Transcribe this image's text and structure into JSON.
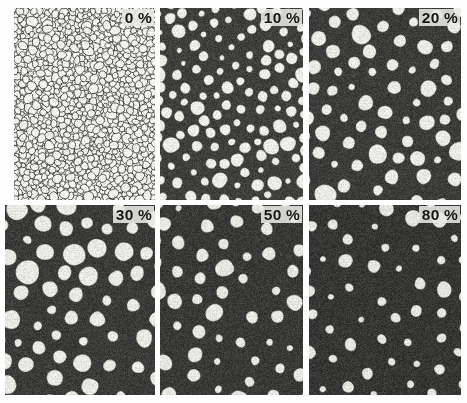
{
  "figure": {
    "rows": 2,
    "columns": 3,
    "background_color": "#fefefe",
    "grain_color": "#ececE6",
    "matrix_color": "#3a3a3a",
    "boundary_color": "#262626",
    "label_text_color": "#141414",
    "label_background_color": "#e8e8e4"
  },
  "panels": [
    {
      "id": "panel-0",
      "label": "0 %",
      "value": 0,
      "unit": "%",
      "row": 0,
      "column": 0,
      "x": 14,
      "y": 8,
      "width": 141,
      "height": 192,
      "grain_count": 1100,
      "mean_grain_diameter_px": 6,
      "boundary_thickness_px": 0.9,
      "matrix_color": "#f2f2ee",
      "grain_color": "#f6f6f2",
      "boundary_color": "#2b2b2b",
      "grain_area_fraction": 0.93,
      "style": "fine-grained network, thin dark boundaries on light field"
    },
    {
      "id": "panel-10",
      "label": "10 %",
      "value": 10,
      "unit": "%",
      "row": 0,
      "column": 1,
      "x": 160,
      "y": 8,
      "width": 143,
      "height": 192,
      "grain_count": 300,
      "mean_grain_diameter_px": 11,
      "boundary_thickness_px": 2.0,
      "matrix_color": "#3f3f3d",
      "grain_color": "#f1f1ec",
      "boundary_color": "#2b2b2b",
      "grain_area_fraction": 0.83,
      "style": "coarsening grains, thickened dark boundaries"
    },
    {
      "id": "panel-20",
      "label": "20 %",
      "value": 20,
      "unit": "%",
      "row": 0,
      "column": 2,
      "x": 309,
      "y": 8,
      "width": 152,
      "height": 192,
      "grain_count": 175,
      "mean_grain_diameter_px": 15,
      "boundary_thickness_px": 3.2,
      "matrix_color": "#3c3c3a",
      "grain_color": "#eeeee9",
      "boundary_color": "#2b2b2b",
      "grain_area_fraction": 0.72,
      "style": "rounded polygonal grains separated by dark matrix channels"
    },
    {
      "id": "panel-30",
      "label": "30 %",
      "value": 30,
      "unit": "%",
      "row": 1,
      "column": 0,
      "x": 5,
      "y": 205,
      "width": 150,
      "height": 190,
      "grain_count": 150,
      "mean_grain_diameter_px": 16,
      "boundary_thickness_px": 4.5,
      "matrix_color": "#3b3b39",
      "grain_color": "#ededE7",
      "boundary_color": "#2b2b2b",
      "grain_area_fraction": 0.62,
      "style": "isolated hexagonal grains in continuous dark matrix"
    },
    {
      "id": "panel-50",
      "label": "50 %",
      "value": 50,
      "unit": "%",
      "row": 1,
      "column": 1,
      "x": 160,
      "y": 205,
      "width": 143,
      "height": 190,
      "grain_count": 120,
      "mean_grain_diameter_px": 14,
      "boundary_thickness_px": 6.5,
      "matrix_color": "#393937",
      "grain_color": "#ebebE5",
      "boundary_color": "#2b2b2b",
      "grain_area_fraction": 0.44,
      "style": "well separated bright grains, dark matrix dominant"
    },
    {
      "id": "panel-80",
      "label": "80 %",
      "value": 80,
      "unit": "%",
      "row": 1,
      "column": 2,
      "x": 309,
      "y": 205,
      "width": 152,
      "height": 190,
      "grain_count": 62,
      "mean_grain_diameter_px": 11,
      "boundary_thickness_px": 9.0,
      "matrix_color": "#363634",
      "grain_color": "#e9e9e3",
      "boundary_color": "#2b2b2b",
      "grain_area_fraction": 0.16,
      "style": "sparse small bright grains dispersed in dark matrix"
    }
  ],
  "chart_data": {
    "type": "heatmap",
    "xlabel": "",
    "ylabel": "",
    "categories": [
      "0 %",
      "10 %",
      "20 %",
      "30 %",
      "50 %",
      "80 %"
    ],
    "series": [
      {
        "name": "grain area fraction",
        "values": [
          0.93,
          0.83,
          0.72,
          0.62,
          0.44,
          0.16
        ]
      },
      {
        "name": "grain count",
        "values": [
          1100,
          300,
          175,
          150,
          120,
          62
        ]
      },
      {
        "name": "mean grain diameter (px)",
        "values": [
          6,
          11,
          15,
          16,
          14,
          11
        ]
      }
    ],
    "grid": false,
    "legend": "none"
  }
}
